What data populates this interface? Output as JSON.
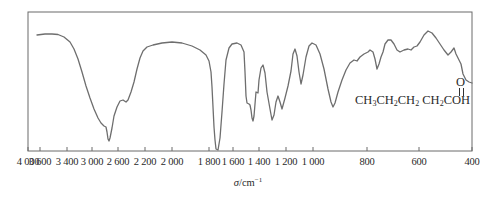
{
  "chart_data": {
    "type": "line",
    "title": "",
    "xlabel": "σ/cm⁻¹",
    "xlabel_symbol": "σ",
    "xlabel_unit": "/cm",
    "xlabel_exp": "−1",
    "ylabel": "",
    "x_reversed": true,
    "xlim": [
      4000,
      400
    ],
    "grid": false,
    "legend": null,
    "x_tick_labels": [
      "4 000",
      "3 600",
      "3 400",
      "3 000",
      "2 600",
      "2 200",
      "2 000",
      "1 800",
      "1 600",
      "1 400",
      "1 200",
      "1 000",
      "800",
      "600",
      "400"
    ],
    "x_tick_pixels": [
      28,
      40,
      67,
      92,
      118,
      145,
      172,
      209,
      233,
      259,
      286,
      313,
      367,
      419,
      472
    ],
    "annotation": {
      "molecule": "CH3CH2CH2CH2COOH",
      "formula_parts": [
        "CH",
        "3",
        "CH",
        "2",
        "CH",
        "2",
        " CH",
        "2",
        "COH"
      ],
      "carbonyl_oxygen": "O"
    },
    "series": [
      {
        "name": "IR transmittance",
        "description": "Relative transmittance (0 = bottom of frame, 100 = top), estimated from pixels",
        "points_px": [
          [
            37,
            23
          ],
          [
            45,
            22
          ],
          [
            52,
            22
          ],
          [
            58,
            22.5
          ],
          [
            64,
            25
          ],
          [
            70,
            30
          ],
          [
            74,
            37
          ],
          [
            78,
            47
          ],
          [
            82,
            60
          ],
          [
            86,
            74
          ],
          [
            90,
            86
          ],
          [
            94,
            97
          ],
          [
            98,
            106
          ],
          [
            101,
            111
          ],
          [
            104,
            114
          ],
          [
            106,
            115
          ],
          [
            107,
            120
          ],
          [
            108,
            127
          ],
          [
            109,
            129
          ],
          [
            110,
            126
          ],
          [
            112,
            116
          ],
          [
            114,
            104
          ],
          [
            117,
            95
          ],
          [
            120,
            89
          ],
          [
            123,
            88
          ],
          [
            126,
            90
          ],
          [
            128,
            88
          ],
          [
            131,
            80
          ],
          [
            134,
            70
          ],
          [
            137,
            57
          ],
          [
            140,
            46
          ],
          [
            143,
            39
          ],
          [
            147,
            35
          ],
          [
            153,
            33
          ],
          [
            162,
            31
          ],
          [
            172,
            30
          ],
          [
            182,
            31
          ],
          [
            192,
            34
          ],
          [
            200,
            38
          ],
          [
            206,
            43
          ],
          [
            209,
            49
          ],
          [
            211,
            60
          ],
          [
            212,
            75
          ],
          [
            213,
            95
          ],
          [
            214,
            115
          ],
          [
            215,
            128
          ],
          [
            216,
            137
          ],
          [
            218,
            138
          ],
          [
            220,
            126
          ],
          [
            222,
            100
          ],
          [
            224,
            72
          ],
          [
            226,
            48
          ],
          [
            229,
            36
          ],
          [
            232,
            32
          ],
          [
            237,
            31
          ],
          [
            241,
            33
          ],
          [
            244,
            40
          ],
          [
            245,
            60
          ],
          [
            246,
            84
          ],
          [
            247,
            91
          ],
          [
            249,
            92
          ],
          [
            250,
            93
          ],
          [
            251,
            98
          ],
          [
            252,
            106
          ],
          [
            253,
            109
          ],
          [
            254,
            104
          ],
          [
            255,
            92
          ],
          [
            256,
            80
          ],
          [
            258,
            81
          ],
          [
            259,
            68
          ],
          [
            261,
            56
          ],
          [
            263,
            53
          ],
          [
            265,
            61
          ],
          [
            267,
            80
          ],
          [
            270,
            97
          ],
          [
            272,
            108
          ],
          [
            274,
            103
          ],
          [
            276,
            90
          ],
          [
            278,
            84
          ],
          [
            280,
            90
          ],
          [
            282,
            97
          ],
          [
            285,
            86
          ],
          [
            288,
            74
          ],
          [
            291,
            59
          ],
          [
            293,
            42
          ],
          [
            295,
            37
          ],
          [
            297,
            44
          ],
          [
            299,
            60
          ],
          [
            301,
            72
          ],
          [
            303,
            63
          ],
          [
            306,
            45
          ],
          [
            309,
            34
          ],
          [
            312,
            31
          ],
          [
            316,
            33
          ],
          [
            320,
            42
          ],
          [
            324,
            57
          ],
          [
            328,
            77
          ],
          [
            331,
            90
          ],
          [
            333,
            95
          ],
          [
            335,
            91
          ],
          [
            338,
            80
          ],
          [
            342,
            68
          ],
          [
            346,
            58
          ],
          [
            350,
            51
          ],
          [
            354,
            48
          ],
          [
            357,
            49
          ],
          [
            360,
            45
          ],
          [
            364,
            42
          ],
          [
            368,
            40
          ],
          [
            370,
            38
          ],
          [
            373,
            40
          ],
          [
            375,
            47
          ],
          [
            377,
            57
          ],
          [
            379,
            52
          ],
          [
            381,
            45
          ],
          [
            383,
            40
          ],
          [
            385,
            32
          ],
          [
            388,
            28
          ],
          [
            391,
            28
          ],
          [
            394,
            32
          ],
          [
            397,
            38
          ],
          [
            400,
            40
          ],
          [
            404,
            38
          ],
          [
            408,
            37
          ],
          [
            411,
            38
          ],
          [
            414,
            35
          ],
          [
            417,
            34
          ],
          [
            420,
            30
          ],
          [
            424,
            23
          ],
          [
            428,
            19
          ],
          [
            432,
            21
          ],
          [
            436,
            26
          ],
          [
            440,
            32
          ],
          [
            444,
            38
          ],
          [
            448,
            43
          ],
          [
            451,
            40
          ],
          [
            454,
            36
          ],
          [
            456,
            42
          ],
          [
            458,
            46
          ],
          [
            461,
            52
          ],
          [
            463,
            62
          ],
          [
            466,
            68
          ],
          [
            469,
            70
          ],
          [
            472,
            71
          ]
        ],
        "key_absorptions_cm-1": {
          "O-H stretch (broad)": 3000,
          "C-H shoulder": 2650,
          "C=O stretch": 1710,
          "C-H bend": 1420,
          "C-O stretch": 1280,
          "O-H out-of-plane bend": 940
        }
      }
    ],
    "frame": {
      "left": 28,
      "right": 472,
      "top": 12,
      "bottom": 151
    },
    "colors": {
      "line": "#6e6e6e",
      "frame": "#6a6a6a",
      "text": "#2a2a2a"
    }
  }
}
